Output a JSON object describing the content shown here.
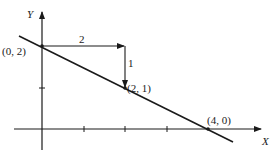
{
  "diagram": {
    "type": "coordinate-plane",
    "axes": {
      "x_label": "X",
      "y_label": "Y"
    },
    "points": [
      {
        "label": "(0, 2)",
        "x": 0,
        "y": 2
      },
      {
        "label": "(2, 1)",
        "x": 2,
        "y": 1
      },
      {
        "label": "(4, 0)",
        "x": 4,
        "y": 0
      }
    ],
    "line": {
      "description": "line through (0, 2) and (4, 0)",
      "slope": -0.5,
      "intercept": 2
    },
    "slope_triangle": {
      "run_label": "2",
      "rise_label": "1"
    },
    "x_ticks": [
      1,
      2,
      3,
      4
    ],
    "y_ticks": [
      1,
      2
    ],
    "colors": {
      "stroke": "#1a1a1a",
      "background": "#ffffff"
    }
  }
}
